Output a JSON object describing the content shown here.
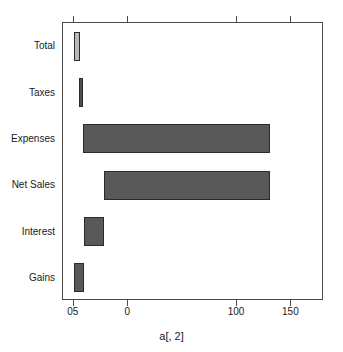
{
  "chart_data": {
    "type": "bar",
    "subtype": "waterfall-horizontal",
    "title": "",
    "subtitle": "",
    "xlabel": "a[, 2]",
    "ylabel": "",
    "orientation": "horizontal",
    "grid": false,
    "legend": null,
    "xlim": [
      -60,
      180
    ],
    "xticks": [
      -50,
      0,
      100,
      150
    ],
    "xtick_labels": [
      "05",
      "0",
      "100",
      "150"
    ],
    "categories": [
      "Total",
      "Taxes",
      "Expenses",
      "Net Sales",
      "Interest",
      "Gains"
    ],
    "bars": [
      {
        "category": "Total",
        "start": -50,
        "end": -44,
        "value": 6,
        "color": "#b9b9b9",
        "border": "#2b2b2b"
      },
      {
        "category": "Taxes",
        "start": -45,
        "end": -42,
        "value": 3,
        "color": "#4f4f4f",
        "border": "#2b2b2b"
      },
      {
        "category": "Expenses",
        "start": -42,
        "end": 130,
        "value": 172,
        "color": "#595959",
        "border": "#2b2b2b"
      },
      {
        "category": "Net Sales",
        "start": -22,
        "end": 130,
        "value": 152,
        "color": "#595959",
        "border": "#2b2b2b"
      },
      {
        "category": "Interest",
        "start": -41,
        "end": -22,
        "value": 19,
        "color": "#595959",
        "border": "#2b2b2b"
      },
      {
        "category": "Gains",
        "start": -50,
        "end": -41,
        "value": 9,
        "color": "#595959",
        "border": "#2b2b2b"
      }
    ],
    "values": [
      6,
      3,
      172,
      152,
      19,
      9
    ],
    "colors": {
      "total_bar": "#b9b9b9",
      "segment_bar": "#595959",
      "bar_border": "#2b2b2b",
      "axis": "#4a4a4a",
      "text": "#1a1a1a",
      "background": "#ffffff"
    }
  }
}
